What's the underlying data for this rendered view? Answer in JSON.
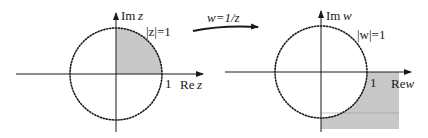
{
  "left_plane": {
    "imag_axis_label": "Im",
    "imag_axis_var": "z",
    "real_axis_label": "Re",
    "real_axis_var": "z",
    "circle_label": "|z|=1",
    "tick_label": "1"
  },
  "mapping": {
    "label": "w=1/z"
  },
  "right_plane": {
    "imag_axis_label": "Im",
    "imag_axis_var": "w",
    "real_axis_label": "Re",
    "real_axis_var": "w",
    "circle_label": "|w|=1",
    "tick_label": "1"
  },
  "colors": {
    "shade": "#c8c8c8",
    "ink": "#1a1a1a"
  }
}
